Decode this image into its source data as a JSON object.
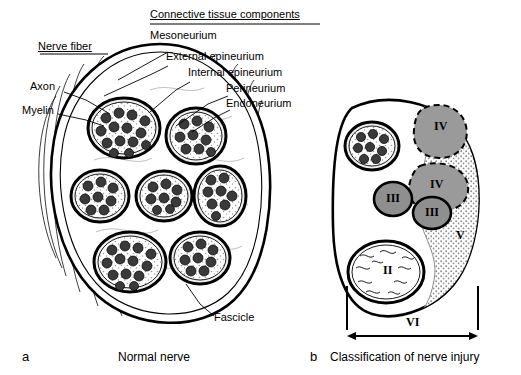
{
  "figure": {
    "title_group_label": "Connective tissue components",
    "nerve_fiber_group_label": "Nerve fiber"
  },
  "labels": {
    "connective_tissue_components": "Connective tissue components",
    "mesoneurium": "Mesoneurium",
    "external_epineurium": "External epineurium",
    "internal_epineurium": "Internal epineurium",
    "perineurium": "Perineurium",
    "endoneurium": "Endoneurium",
    "nerve_fiber": "Nerve fiber",
    "axon": "Axon",
    "myelin": "Myelin",
    "fascicle": "Fascicle"
  },
  "panels": {
    "a": {
      "letter": "a",
      "caption": "Normal nerve"
    },
    "b": {
      "letter": "b",
      "caption": "Classification of nerve injury",
      "degrees": [
        {
          "id": "degree-2",
          "label": "II"
        },
        {
          "id": "degree-3a",
          "label": "III"
        },
        {
          "id": "degree-3b",
          "label": "III"
        },
        {
          "id": "degree-4a",
          "label": "IV"
        },
        {
          "id": "degree-4b",
          "label": "IV"
        },
        {
          "id": "degree-5",
          "label": "V"
        },
        {
          "id": "degree-6",
          "label": "VI"
        }
      ]
    }
  },
  "colors": {
    "ink": "#000000",
    "background": "#ffffff",
    "fascicle_fill": "#f2f2f2",
    "axon_fill": "#3a3a3a",
    "stipple_gray": "#b5b5b5",
    "injury_fill": "#9a9a9a"
  }
}
